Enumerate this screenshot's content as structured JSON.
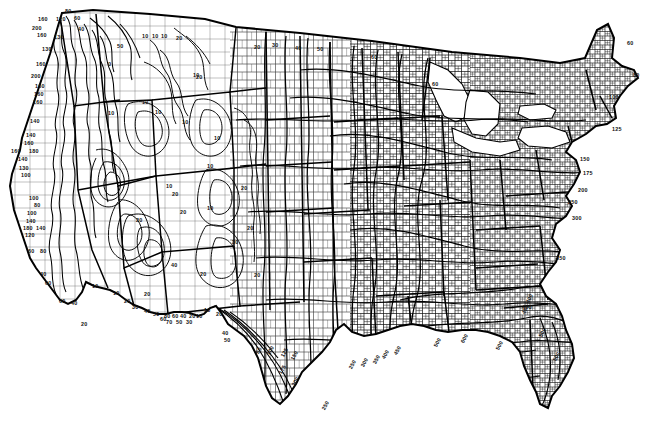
{
  "document": {
    "type": "scanned-contour-map",
    "title": "Isopluvial contour map of the contiguous United States",
    "subject": "Precipitation / rainfall frequency contours over county boundaries",
    "background_color": "#ffffff",
    "ink_color": "#000000",
    "width": 649,
    "height": 424
  },
  "map": {
    "region": "Contiguous United States (48 states)",
    "features": [
      "national-outline",
      "state-boundaries",
      "county-boundaries",
      "contour-lines",
      "great-lakes"
    ],
    "contour_label_values": [
      0,
      10,
      20,
      30,
      40,
      50,
      60,
      70,
      80,
      100,
      120,
      125,
      130,
      140,
      150,
      160,
      175,
      180,
      200,
      240,
      250,
      300,
      350,
      400,
      450,
      500,
      600
    ]
  },
  "chart_data": {
    "type": "contour",
    "xlabel": "",
    "ylabel": "",
    "units": "",
    "legend_position": "none",
    "grid": false,
    "contour_levels": [
      0,
      10,
      20,
      30,
      40,
      50,
      60,
      70,
      80,
      100,
      120,
      125,
      130,
      140,
      150,
      160,
      175,
      180,
      200,
      240,
      250,
      300,
      350,
      400,
      450,
      500,
      600
    ],
    "regional_ranges": [
      {
        "region": "Pacific Northwest coast (Olympic / Cascades)",
        "min": 60,
        "max": 200
      },
      {
        "region": "Northern California coast range",
        "min": 100,
        "max": 180
      },
      {
        "region": "Sierra Nevada",
        "min": 60,
        "max": 140
      },
      {
        "region": "Southern California coast",
        "min": 40,
        "max": 80
      },
      {
        "region": "Great Basin / Nevada interior",
        "min": 0,
        "max": 20
      },
      {
        "region": "Arizona / New Mexico mountains",
        "min": 10,
        "max": 80
      },
      {
        "region": "Northern Rockies / Montana border",
        "min": 10,
        "max": 40
      },
      {
        "region": "Northern Plains (Dakotas / Minnesota)",
        "min": 20,
        "max": 60
      },
      {
        "region": "Central Plains (Kansas / Nebraska)",
        "min": 60,
        "max": 150
      },
      {
        "region": "Texas Gulf coast",
        "min": 80,
        "max": 250
      },
      {
        "region": "Lower Mississippi valley",
        "min": 250,
        "max": 400
      },
      {
        "region": "Gulf coast (Louisiana / Mississippi / Alabama)",
        "min": 400,
        "max": 600
      },
      {
        "region": "Florida peninsula",
        "min": 500,
        "max": 600
      },
      {
        "region": "Southeast Atlantic coast (Georgia / Carolinas)",
        "min": 350,
        "max": 500
      },
      {
        "region": "Mid-Atlantic coast",
        "min": 150,
        "max": 300
      },
      {
        "region": "New England",
        "min": 60,
        "max": 125
      }
    ]
  },
  "labels": [
    {
      "t": "80",
      "x": 65,
      "y": 9,
      "r": 0
    },
    {
      "t": "160",
      "x": 38,
      "y": 17,
      "r": 0
    },
    {
      "t": "120",
      "x": 56,
      "y": 17,
      "r": 0
    },
    {
      "t": "60",
      "x": 74,
      "y": 16,
      "r": 0
    },
    {
      "t": "200",
      "x": 32,
      "y": 26,
      "r": 0
    },
    {
      "t": "40",
      "x": 78,
      "y": 27,
      "r": 0
    },
    {
      "t": "160",
      "x": 37,
      "y": 33,
      "r": 0
    },
    {
      "t": "130",
      "x": 54,
      "y": 35,
      "r": 0
    },
    {
      "t": "130",
      "x": 42,
      "y": 47,
      "r": 0
    },
    {
      "t": "160",
      "x": 36,
      "y": 62,
      "r": 0
    },
    {
      "t": "200",
      "x": 31,
      "y": 74,
      "r": 0
    },
    {
      "t": "160",
      "x": 35,
      "y": 84,
      "r": 0
    },
    {
      "t": "160",
      "x": 34,
      "y": 92,
      "r": 0
    },
    {
      "t": "160",
      "x": 33,
      "y": 100,
      "r": 0
    },
    {
      "t": "140",
      "x": 30,
      "y": 119,
      "r": 0
    },
    {
      "t": "140",
      "x": 26,
      "y": 133,
      "r": 0
    },
    {
      "t": "160",
      "x": 24,
      "y": 141,
      "r": 0
    },
    {
      "t": "160",
      "x": 11,
      "y": 149,
      "r": 0
    },
    {
      "t": "180",
      "x": 29,
      "y": 149,
      "r": 0
    },
    {
      "t": "140",
      "x": 18,
      "y": 157,
      "r": 0
    },
    {
      "t": "130",
      "x": 19,
      "y": 166,
      "r": 0
    },
    {
      "t": "100",
      "x": 21,
      "y": 173,
      "r": 0
    },
    {
      "t": "100",
      "x": 29,
      "y": 196,
      "r": 0
    },
    {
      "t": "80",
      "x": 34,
      "y": 203,
      "r": 0
    },
    {
      "t": "100",
      "x": 27,
      "y": 211,
      "r": 0
    },
    {
      "t": "140",
      "x": 26,
      "y": 219,
      "r": 0
    },
    {
      "t": "180",
      "x": 23,
      "y": 226,
      "r": 0
    },
    {
      "t": "140",
      "x": 36,
      "y": 226,
      "r": 0
    },
    {
      "t": "120",
      "x": 25,
      "y": 233,
      "r": 0
    },
    {
      "t": "60",
      "x": 28,
      "y": 249,
      "r": 0
    },
    {
      "t": "80",
      "x": 40,
      "y": 249,
      "r": 0
    },
    {
      "t": "40",
      "x": 40,
      "y": 272,
      "r": 0
    },
    {
      "t": "60",
      "x": 45,
      "y": 281,
      "r": 0
    },
    {
      "t": "60",
      "x": 59,
      "y": 299,
      "r": 0
    },
    {
      "t": "40",
      "x": 71,
      "y": 301,
      "r": 0
    },
    {
      "t": "20",
      "x": 81,
      "y": 322,
      "r": 0
    },
    {
      "t": "50",
      "x": 117,
      "y": 44,
      "r": 0
    },
    {
      "t": "0",
      "x": 108,
      "y": 62,
      "r": 0
    },
    {
      "t": "10",
      "x": 142,
      "y": 34,
      "r": 0
    },
    {
      "t": "10",
      "x": 152,
      "y": 34,
      "r": 0
    },
    {
      "t": "10",
      "x": 161,
      "y": 34,
      "r": 0
    },
    {
      "t": "20",
      "x": 176,
      "y": 36,
      "r": 0
    },
    {
      "t": "20",
      "x": 196,
      "y": 75,
      "r": 0
    },
    {
      "t": "10",
      "x": 193,
      "y": 73,
      "r": 0
    },
    {
      "t": "10",
      "x": 142,
      "y": 100,
      "r": 0
    },
    {
      "t": "10",
      "x": 108,
      "y": 111,
      "r": 0
    },
    {
      "t": "10",
      "x": 155,
      "y": 110,
      "r": 0
    },
    {
      "t": "10",
      "x": 182,
      "y": 120,
      "r": 0
    },
    {
      "t": "10",
      "x": 214,
      "y": 136,
      "r": 0
    },
    {
      "t": "10",
      "x": 166,
      "y": 184,
      "r": 0
    },
    {
      "t": "20",
      "x": 172,
      "y": 192,
      "r": 0
    },
    {
      "t": "10",
      "x": 207,
      "y": 164,
      "r": 0
    },
    {
      "t": "20",
      "x": 136,
      "y": 218,
      "r": 0
    },
    {
      "t": "10",
      "x": 207,
      "y": 206,
      "r": 0
    },
    {
      "t": "20",
      "x": 241,
      "y": 186,
      "r": 0
    },
    {
      "t": "20",
      "x": 247,
      "y": 226,
      "r": 0
    },
    {
      "t": "30",
      "x": 232,
      "y": 240,
      "r": 0
    },
    {
      "t": "20",
      "x": 200,
      "y": 272,
      "r": 0
    },
    {
      "t": "40",
      "x": 171,
      "y": 263,
      "r": 0
    },
    {
      "t": "20",
      "x": 144,
      "y": 292,
      "r": 0
    },
    {
      "t": "20",
      "x": 180,
      "y": 210,
      "r": 0
    },
    {
      "t": "20",
      "x": 254,
      "y": 273,
      "r": 0
    },
    {
      "t": "20",
      "x": 254,
      "y": 45,
      "r": 0
    },
    {
      "t": "30",
      "x": 272,
      "y": 43,
      "r": 0
    },
    {
      "t": "40",
      "x": 295,
      "y": 46,
      "r": 0
    },
    {
      "t": "50",
      "x": 317,
      "y": 47,
      "r": 0
    },
    {
      "t": "60",
      "x": 371,
      "y": 55,
      "r": 0
    },
    {
      "t": "60",
      "x": 432,
      "y": 82,
      "r": 0
    },
    {
      "t": "10",
      "x": 92,
      "y": 284,
      "r": 0
    },
    {
      "t": "10",
      "x": 113,
      "y": 291,
      "r": 0
    },
    {
      "t": "20",
      "x": 124,
      "y": 299,
      "r": 0
    },
    {
      "t": "30",
      "x": 132,
      "y": 305,
      "r": 0
    },
    {
      "t": "40",
      "x": 144,
      "y": 309,
      "r": 0
    },
    {
      "t": "50",
      "x": 153,
      "y": 312,
      "r": 0
    },
    {
      "t": "60",
      "x": 160,
      "y": 317,
      "r": 0
    },
    {
      "t": "80",
      "x": 164,
      "y": 314,
      "r": 0
    },
    {
      "t": "60",
      "x": 172,
      "y": 314,
      "r": 0
    },
    {
      "t": "40",
      "x": 180,
      "y": 314,
      "r": 0
    },
    {
      "t": "20",
      "x": 189,
      "y": 314,
      "r": 0
    },
    {
      "t": "10",
      "x": 196,
      "y": 314,
      "r": 0
    },
    {
      "t": "70",
      "x": 166,
      "y": 320,
      "r": 0
    },
    {
      "t": "50",
      "x": 176,
      "y": 320,
      "r": 0
    },
    {
      "t": "30",
      "x": 186,
      "y": 320,
      "r": 0
    },
    {
      "t": "10",
      "x": 204,
      "y": 308,
      "r": 0
    },
    {
      "t": "20",
      "x": 216,
      "y": 312,
      "r": 0
    },
    {
      "t": "40",
      "x": 222,
      "y": 331,
      "r": 0
    },
    {
      "t": "50",
      "x": 224,
      "y": 338,
      "r": 0
    },
    {
      "t": "80",
      "x": 256,
      "y": 348,
      "r": -62
    },
    {
      "t": "100",
      "x": 266,
      "y": 348,
      "r": -62
    },
    {
      "t": "125",
      "x": 280,
      "y": 350,
      "r": -62
    },
    {
      "t": "150",
      "x": 290,
      "y": 353,
      "r": -62
    },
    {
      "t": "175",
      "x": 278,
      "y": 367,
      "r": -62
    },
    {
      "t": "200",
      "x": 291,
      "y": 379,
      "r": -62
    },
    {
      "t": "250",
      "x": 321,
      "y": 403,
      "r": -62
    },
    {
      "t": "250",
      "x": 348,
      "y": 362,
      "r": -62
    },
    {
      "t": "300",
      "x": 360,
      "y": 360,
      "r": -62
    },
    {
      "t": "350",
      "x": 372,
      "y": 357,
      "r": -62
    },
    {
      "t": "400",
      "x": 381,
      "y": 352,
      "r": -62
    },
    {
      "t": "450",
      "x": 393,
      "y": 348,
      "r": -62
    },
    {
      "t": "500",
      "x": 433,
      "y": 340,
      "r": -62
    },
    {
      "t": "600",
      "x": 460,
      "y": 336,
      "r": -62
    },
    {
      "t": "500",
      "x": 495,
      "y": 343,
      "r": -62
    },
    {
      "t": "500",
      "x": 538,
      "y": 330,
      "r": -62
    },
    {
      "t": "500",
      "x": 552,
      "y": 354,
      "r": -62
    },
    {
      "t": "450",
      "x": 521,
      "y": 307,
      "r": -62
    },
    {
      "t": "400",
      "x": 525,
      "y": 296,
      "r": -62
    },
    {
      "t": "60",
      "x": 627,
      "y": 41,
      "r": 0
    },
    {
      "t": "80",
      "x": 633,
      "y": 73,
      "r": 0
    },
    {
      "t": "100",
      "x": 609,
      "y": 95,
      "r": 0
    },
    {
      "t": "125",
      "x": 612,
      "y": 127,
      "r": 0
    },
    {
      "t": "150",
      "x": 580,
      "y": 157,
      "r": 0
    },
    {
      "t": "175",
      "x": 583,
      "y": 171,
      "r": 0
    },
    {
      "t": "200",
      "x": 578,
      "y": 188,
      "r": 0
    },
    {
      "t": "250",
      "x": 568,
      "y": 200,
      "r": 0
    },
    {
      "t": "300",
      "x": 572,
      "y": 216,
      "r": 0
    },
    {
      "t": "350",
      "x": 556,
      "y": 256,
      "r": 0
    },
    {
      "t": "400",
      "x": 522,
      "y": 305,
      "r": 0
    }
  ]
}
